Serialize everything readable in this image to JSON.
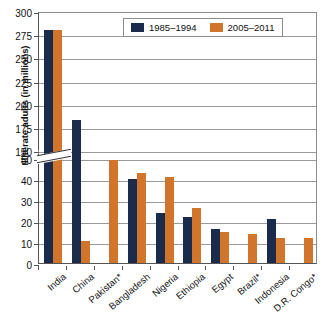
{
  "chart_data": {
    "type": "bar",
    "title": "",
    "xlabel": "",
    "ylabel": "Illiterate adults (in millions)",
    "categories": [
      "India",
      "China",
      "Pakistan*",
      "Bangladesh",
      "Nigeria",
      "Ethiopia",
      "Egypt",
      "Brazil*",
      "Indonesia",
      "D.R. Congo*"
    ],
    "series": [
      {
        "name": "1985–1994",
        "color": "#1b2b4b",
        "values": [
          280,
          182,
          null,
          40,
          24,
          22,
          16,
          null,
          21,
          null
        ]
      },
      {
        "name": "2005–2011",
        "color": "#d2752c",
        "values": [
          280,
          52,
          49,
          43,
          41,
          26,
          15,
          14,
          12,
          12
        ]
      }
    ],
    "axis_break": {
      "present": true,
      "lower_max": 50,
      "upper_min": 150
    },
    "yticks_lower": [
      0,
      10,
      20,
      30,
      40,
      50
    ],
    "yticks_upper": [
      150,
      175,
      200,
      225,
      250,
      275,
      300
    ],
    "ylim": [
      0,
      300
    ],
    "grid": true,
    "legend_position": "top-right"
  },
  "legend": {
    "items": [
      {
        "label": "1985–1994",
        "color": "#1b2b4b"
      },
      {
        "label": "2005–2011",
        "color": "#d2752c"
      }
    ]
  },
  "yaxis": {
    "title": "Illiterate adults (in millions)",
    "ticks": [
      "300",
      "275",
      "250",
      "225",
      "200",
      "175",
      "150",
      "50",
      "40",
      "30",
      "20",
      "10",
      "0"
    ]
  },
  "xaxis": {
    "labels": [
      "India",
      "China",
      "Pakistan*",
      "Bangladesh",
      "Nigeria",
      "Ethiopia",
      "Egypt",
      "Brazil*",
      "Indonesia",
      "D.R. Congo*"
    ]
  }
}
